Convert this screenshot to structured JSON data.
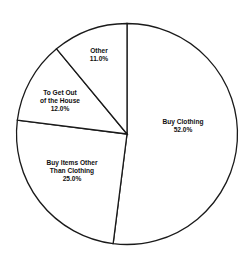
{
  "chart_data": {
    "type": "pie",
    "title": "",
    "start_angle": "12 o'clock",
    "direction": "clockwise",
    "categories": [
      "Buy Clothing",
      "Buy Items Other Than Clothing",
      "To Get Out of the House",
      "Other"
    ],
    "values": [
      52.0,
      25.0,
      12.0,
      11.0
    ],
    "unit": "%",
    "legend": "none (inline labels)",
    "slices": [
      {
        "label_lines": [
          "Buy Clothing"
        ],
        "value_text": "52.0%",
        "value": 52.0
      },
      {
        "label_lines": [
          "Buy Items Other",
          "Than Clothing"
        ],
        "value_text": "25.0%",
        "value": 25.0
      },
      {
        "label_lines": [
          "To Get Out",
          "of the House"
        ],
        "value_text": "12.0%",
        "value": 12.0
      },
      {
        "label_lines": [
          "Other"
        ],
        "value_text": "11.0%",
        "value": 11.0
      }
    ]
  },
  "labels": {
    "s0": {
      "l1": "Buy Clothing",
      "v": "52.0%"
    },
    "s1": {
      "l1": "Buy Items Other",
      "l2": "Than Clothing",
      "v": "25.0%"
    },
    "s2": {
      "l1": "To Get Out",
      "l2": "of the House",
      "v": "12.0%"
    },
    "s3": {
      "l1": "Other",
      "v": "11.0%"
    }
  },
  "colors": {
    "fill": "#ffffff",
    "stroke": "#1a1a1a",
    "text": "#111111"
  }
}
